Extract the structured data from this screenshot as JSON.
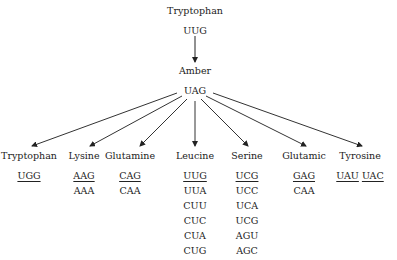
{
  "root": {
    "label": "Tryptophan",
    "codon": "UUG"
  },
  "mutant": {
    "label": "Amber",
    "codon": "UAG"
  },
  "columns": [
    {
      "label": "Tryptophan",
      "x": 29,
      "codons": [
        {
          "c": "UGG",
          "u": true
        }
      ]
    },
    {
      "label": "Lysine",
      "x": 84,
      "codons": [
        {
          "c": "AAG",
          "u": true
        },
        {
          "c": "AAA",
          "u": false
        }
      ]
    },
    {
      "label": "Glutamine",
      "x": 130,
      "codons": [
        {
          "c": "CAG",
          "u": true
        },
        {
          "c": "CAA",
          "u": false
        }
      ]
    },
    {
      "label": "Leucine",
      "x": 195,
      "codons": [
        {
          "c": "UUG",
          "u": true
        },
        {
          "c": "UUA",
          "u": false
        },
        {
          "c": "CUU",
          "u": false
        },
        {
          "c": "CUC",
          "u": false
        },
        {
          "c": "CUA",
          "u": false
        },
        {
          "c": "CUG",
          "u": false
        }
      ]
    },
    {
      "label": "Serine",
      "x": 247,
      "codons": [
        {
          "c": "UCG",
          "u": true
        },
        {
          "c": "UCC",
          "u": false
        },
        {
          "c": "UCA",
          "u": false
        },
        {
          "c": "UCG",
          "u": false
        },
        {
          "c": "AGU",
          "u": false
        },
        {
          "c": "AGC",
          "u": false
        }
      ]
    },
    {
      "label": "Glutamic",
      "x": 304,
      "codons": [
        {
          "c": "GAG",
          "u": true
        },
        {
          "c": "CAA",
          "u": false
        }
      ]
    },
    {
      "label": "Tyrosine",
      "x": 360,
      "codons": [
        {
          "c": "UAU",
          "u": true
        },
        {
          "c": "UAC",
          "u": true
        }
      ]
    }
  ]
}
